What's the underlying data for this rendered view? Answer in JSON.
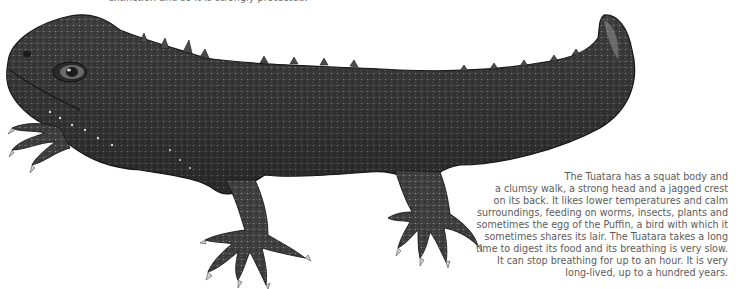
{
  "top_caption": "extinction and so it is strongly protected.",
  "illustration": {
    "subject": "Tuatara",
    "style": "black-and-white stipple drawing",
    "colors": {
      "dark": "#2a2a2a",
      "mid": "#5a5a5a",
      "light": "#9a9a9a",
      "background": "#ffffff"
    }
  },
  "description": {
    "lines": [
      "The Tuatara has a squat body and",
      "a clumsy walk, a strong head and a jagged crest",
      "on its back. It likes lower temperatures and calm",
      "surroundings, feeding on worms, insects, plants and",
      "sometimes the egg of the Puffin, a bird with which it",
      "sometimes shares its lair. The Tuatara takes a long",
      "time to digest its food and its breathing is very slow.",
      "It can stop breathing for up to an hour. It is very",
      "long-lived, up to a hundred years."
    ],
    "text_color": "#5c5c5c"
  }
}
